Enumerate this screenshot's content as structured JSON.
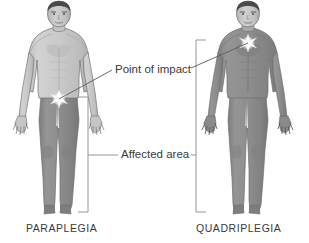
{
  "diagram": {
    "background_color": "#ffffff",
    "palette": {
      "unaffected_body": "#c9c9c9",
      "affected_body": "#8b8b8b",
      "outline": "#6e6e6e",
      "hair": "#4a4a4a",
      "text": "#3a3a3a",
      "leader_line": "#5a5a5a",
      "bracket": "#8a8a8a",
      "impact_star": "#ffffff"
    },
    "annotations": [
      {
        "id": "point-of-impact",
        "label": "Point of impact"
      },
      {
        "id": "affected-area",
        "label": "Affected area"
      }
    ],
    "figures": [
      {
        "id": "paraplegia",
        "caption": "PARAPLEGIA",
        "impact_level": "waist",
        "affected_region": "lower body",
        "impact_point": {
          "x": 59,
          "y": 99
        },
        "bracket": {
          "x": 88,
          "top": 97,
          "bottom": 212
        }
      },
      {
        "id": "quadriplegia",
        "caption": "QUADRIPLEGIA",
        "impact_level": "neck",
        "affected_region": "entire body below neck",
        "impact_point": {
          "x": 248,
          "y": 43
        },
        "bracket": {
          "x": 196,
          "top": 40,
          "bottom": 212
        }
      }
    ],
    "leader_lines": [
      {
        "id": "impact-leader-left",
        "from": [
          59,
          99
        ],
        "to": [
          112,
          70
        ]
      },
      {
        "id": "impact-leader-right",
        "from": [
          191,
          68
        ],
        "to": [
          248,
          43
        ]
      },
      {
        "id": "area-leader-left",
        "from": [
          88,
          155
        ],
        "to": [
          118,
          155
        ]
      },
      {
        "id": "area-leader-right",
        "from": [
          191,
          155
        ],
        "to": [
          196,
          155
        ]
      }
    ]
  }
}
